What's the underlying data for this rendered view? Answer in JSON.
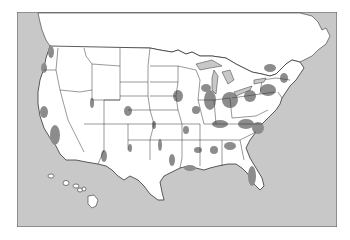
{
  "map": {
    "type": "choropleth-outline",
    "region": "United States (contiguous + Hawaii)",
    "colors": {
      "water": "#c8c8c8",
      "land": "#ffffff",
      "shaded": "#8c8c8c",
      "border": "#333333",
      "frame": "#555555"
    },
    "labels": []
  }
}
